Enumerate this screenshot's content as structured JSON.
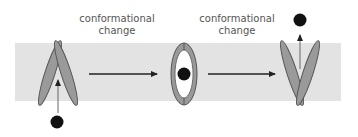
{
  "labels": {
    "step1": [
      "conformational",
      "change"
    ],
    "step2": [
      "conformational",
      "change"
    ]
  },
  "colors": {
    "membrane": "#e3e3e3",
    "subunit_fill": "#9a9a9a",
    "subunit_stroke": "#555555",
    "ligand": "#111111",
    "arrow": "#222222"
  },
  "states": [
    "open-to-outside",
    "occluded",
    "open-to-inside"
  ]
}
